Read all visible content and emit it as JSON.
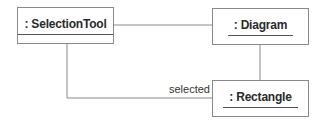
{
  "diagram": {
    "type": "UML object diagram",
    "objects": [
      {
        "id": "selection-tool",
        "label": ": SelectionTool"
      },
      {
        "id": "diagram",
        "label": ": Diagram"
      },
      {
        "id": "rectangle",
        "label": ": Rectangle"
      }
    ],
    "links": [
      {
        "from": "selection-tool",
        "to": "diagram",
        "label": ""
      },
      {
        "from": "diagram",
        "to": "rectangle",
        "label": ""
      },
      {
        "from": "selection-tool",
        "to": "rectangle",
        "label": "selected"
      }
    ],
    "colors": {
      "line": "#8a8a8a",
      "text": "#2a2a2a",
      "background": "#ffffff"
    }
  }
}
